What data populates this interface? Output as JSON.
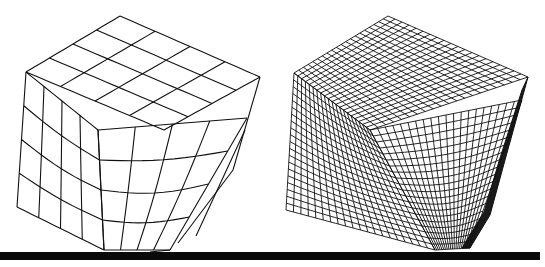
{
  "figure": {
    "width": 545,
    "height": 267,
    "background": "#ffffff",
    "line_color": "#111111",
    "floor": {
      "x": 0,
      "y": 252,
      "width": 540,
      "height": 8,
      "color": "#0a0a0a"
    }
  },
  "panels": [
    {
      "id": "coarse-mesh",
      "mesh_divisions": 4,
      "stroke_width": 1.1,
      "faces": {
        "top": {
          "a": [
            26,
            72
          ],
          "b": [
            120,
            16
          ],
          "c": [
            260,
            77
          ],
          "d": [
            164,
            130
          ]
        },
        "left": {
          "a": [
            26,
            72
          ],
          "b": [
            98,
            130
          ],
          "c": [
            104,
            250
          ],
          "d": [
            17,
            207
          ]
        },
        "front": {
          "a": [
            98,
            130
          ],
          "b": [
            247,
            118
          ],
          "c": [
            170,
            250
          ],
          "d": [
            104,
            250
          ]
        }
      },
      "inner_box": {
        "a": [
          98,
          130
        ],
        "b": [
          164,
          130
        ],
        "c": [
          247,
          118
        ]
      },
      "fold_lines": [
        [
          [
            260,
            77
          ],
          [
            233,
            170
          ]
        ],
        [
          [
            233,
            170
          ],
          [
            178,
            243
          ]
        ],
        [
          [
            245,
            130
          ],
          [
            196,
            236
          ]
        ],
        [
          [
            170,
            250
          ],
          [
            150,
            252
          ]
        ]
      ]
    },
    {
      "id": "fine-mesh",
      "mesh_divisions": 20,
      "stroke_width": 0.9,
      "faces": {
        "top": {
          "a": [
            294,
            73
          ],
          "b": [
            388,
            16
          ],
          "c": [
            528,
            77
          ],
          "d": [
            370,
            130
          ]
        },
        "left": {
          "a": [
            294,
            73
          ],
          "b": [
            370,
            130
          ],
          "c": [
            435,
            250
          ],
          "d": [
            286,
            210
          ]
        },
        "front": {
          "a": [
            370,
            130
          ],
          "b": [
            522,
            100
          ],
          "c": [
            470,
            248
          ],
          "d": [
            435,
            250
          ]
        }
      },
      "fold_shadow": [
        [
          528,
          77
        ],
        [
          505,
          160
        ],
        [
          490,
          215
        ],
        [
          470,
          248
        ],
        [
          462,
          248
        ],
        [
          484,
          212
        ],
        [
          500,
          158
        ],
        [
          522,
          90
        ]
      ]
    }
  ]
}
